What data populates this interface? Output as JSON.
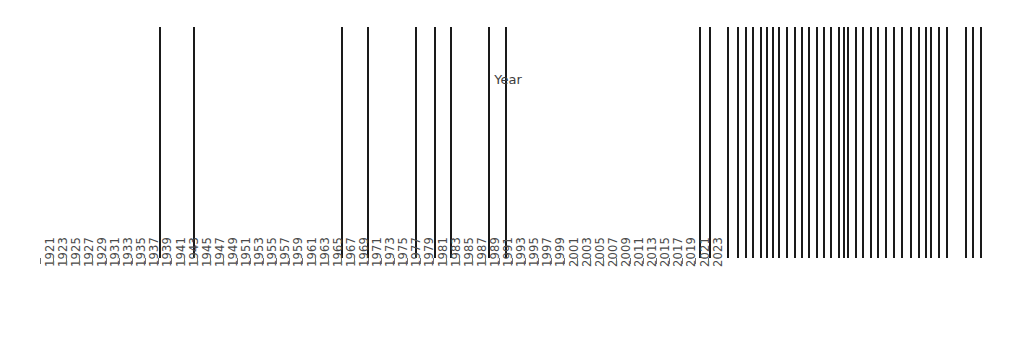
{
  "chart_data": {
    "type": "bar",
    "title": "",
    "subtitle": "",
    "xlabel": "Year",
    "ylabel": "",
    "grid": false,
    "legend": null,
    "annotations": [],
    "xlim": [
      1920,
      2024
    ],
    "x_tick_start": 1921,
    "x_tick_end": 2023,
    "x_tick_step": 2,
    "tick_labels": [
      "1921",
      "1923",
      "1925",
      "1927",
      "1929",
      "1931",
      "1933",
      "1935",
      "1937",
      "1939",
      "1941",
      "1943",
      "1945",
      "1947",
      "1949",
      "1951",
      "1953",
      "1955",
      "1957",
      "1959",
      "1961",
      "1963",
      "1965",
      "1967",
      "1969",
      "1971",
      "1973",
      "1975",
      "1977",
      "1979",
      "1981",
      "1983",
      "1985",
      "1987",
      "1989",
      "1991",
      "1993",
      "1995",
      "1997",
      "1999",
      "2001",
      "2003",
      "2005",
      "2007",
      "2009",
      "2011",
      "2013",
      "2015",
      "2017",
      "2019",
      "2021",
      "2023"
    ],
    "series_name": "events",
    "mark_color": "#1a1a1a",
    "x": [
      1933.2,
      1938.4,
      1953.0,
      1957.0,
      1960.2,
      1963.1,
      1965.5,
      1971.1,
      1973.7,
      1991.6,
      1993.1,
      1995.8,
      1997.3,
      1998.5,
      1999.6,
      2000.8,
      2001.7,
      2001.9,
      2002.8,
      2003.7,
      2004.9,
      2006.1,
      2007.2,
      2008.3,
      2009.5,
      2010.6,
      2011.7,
      2012.8,
      2014.0,
      2014.8,
      2015.4,
      2016.6,
      2017.7,
      2018.9,
      2020.0,
      2021.2,
      2022.4,
      2023.6,
      2024.8,
      2026.0,
      2027.2
    ],
    "values": [
      1,
      1,
      1,
      1,
      1,
      1,
      1,
      1,
      1,
      1,
      1,
      1,
      1,
      1,
      1,
      1,
      1,
      1,
      1,
      1,
      1,
      1,
      1,
      1,
      1,
      1,
      1,
      1,
      1,
      1,
      1,
      1,
      1,
      1,
      1,
      1,
      1,
      1,
      1,
      1,
      1
    ],
    "marks_px": [
      159,
      193,
      341,
      367,
      415,
      434,
      450,
      488,
      505,
      699,
      709,
      727,
      737,
      745,
      752,
      760,
      766,
      772,
      778,
      786,
      794,
      801,
      808,
      816,
      823,
      830,
      838,
      843,
      847,
      855,
      862,
      870,
      877,
      885,
      893,
      901,
      910,
      918,
      925,
      930,
      938,
      946,
      965,
      972,
      980
    ]
  },
  "axis": {
    "label": "Year"
  }
}
